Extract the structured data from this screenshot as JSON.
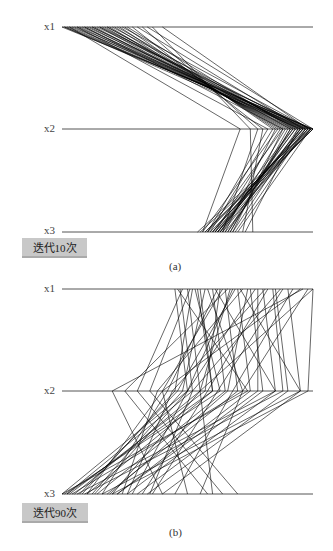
{
  "chart_data": [
    {
      "type": "parallel_coordinates",
      "title": "",
      "caption": "(a)",
      "badge": "迭代10次",
      "axes": [
        "x1",
        "x2",
        "x3"
      ],
      "axis_range_px": [
        62,
        313
      ],
      "normalized_range": [
        0,
        1
      ],
      "grid": false,
      "legend": "none",
      "description": "Parallel coordinates plot after 10 iterations; lines cluster at low x1, high x2 (near max), mid-high x3",
      "lines": [
        [
          0.0,
          1.0,
          0.55
        ],
        [
          0.01,
          0.98,
          0.57
        ],
        [
          0.02,
          0.97,
          0.58
        ],
        [
          0.03,
          0.96,
          0.6
        ],
        [
          0.04,
          1.0,
          0.59
        ],
        [
          0.05,
          0.95,
          0.61
        ],
        [
          0.06,
          0.99,
          0.62
        ],
        [
          0.07,
          0.93,
          0.63
        ],
        [
          0.08,
          0.97,
          0.64
        ],
        [
          0.09,
          0.92,
          0.6
        ],
        [
          0.1,
          0.98,
          0.65
        ],
        [
          0.11,
          0.91,
          0.66
        ],
        [
          0.12,
          0.96,
          0.62
        ],
        [
          0.13,
          0.9,
          0.67
        ],
        [
          0.14,
          0.99,
          0.63
        ],
        [
          0.15,
          0.89,
          0.64
        ],
        [
          0.16,
          0.95,
          0.68
        ],
        [
          0.17,
          0.88,
          0.58
        ],
        [
          0.18,
          0.94,
          0.66
        ],
        [
          0.19,
          0.87,
          0.61
        ],
        [
          0.2,
          0.97,
          0.69
        ],
        [
          0.21,
          0.86,
          0.56
        ],
        [
          0.22,
          0.93,
          0.62
        ],
        [
          0.23,
          0.85,
          0.65
        ],
        [
          0.24,
          0.99,
          0.7
        ],
        [
          0.25,
          0.84,
          0.59
        ],
        [
          0.26,
          0.92,
          0.63
        ],
        [
          0.28,
          0.8,
          0.72
        ],
        [
          0.3,
          0.96,
          0.6
        ],
        [
          0.32,
          0.78,
          0.64
        ],
        [
          0.34,
          1.0,
          0.57
        ],
        [
          0.36,
          0.75,
          0.76
        ],
        [
          0.4,
          0.98,
          0.61
        ],
        [
          0.03,
          0.71,
          0.56
        ],
        [
          0.06,
          0.82,
          0.58
        ],
        [
          0.09,
          0.88,
          0.68
        ],
        [
          0.12,
          0.94,
          0.73
        ],
        [
          0.15,
          0.99,
          0.54
        ],
        [
          0.18,
          0.91,
          0.67
        ],
        [
          0.01,
          0.95,
          0.62
        ]
      ]
    },
    {
      "type": "parallel_coordinates",
      "title": "",
      "caption": "(b)",
      "badge": "迭代90次",
      "axes": [
        "x1",
        "x2",
        "x3"
      ],
      "axis_range_px": [
        62,
        313
      ],
      "normalized_range": [
        0,
        1
      ],
      "grid": false,
      "legend": "none",
      "description": "Parallel coordinates plot after 90 iterations; lines spread widely, x1 mid-high, x2 broad, x3 low-mid",
      "lines": [
        [
          0.45,
          0.5,
          0.0
        ],
        [
          0.47,
          0.52,
          0.02
        ],
        [
          0.5,
          0.55,
          0.05
        ],
        [
          0.52,
          0.45,
          0.08
        ],
        [
          0.55,
          0.6,
          0.1
        ],
        [
          0.57,
          0.48,
          0.12
        ],
        [
          0.6,
          0.65,
          0.14
        ],
        [
          0.62,
          0.42,
          0.16
        ],
        [
          0.65,
          0.7,
          0.18
        ],
        [
          0.67,
          0.55,
          0.2
        ],
        [
          0.7,
          0.75,
          0.22
        ],
        [
          0.72,
          0.38,
          0.24
        ],
        [
          0.75,
          0.8,
          0.26
        ],
        [
          0.77,
          0.5,
          0.28
        ],
        [
          0.8,
          0.85,
          0.3
        ],
        [
          0.82,
          0.58,
          0.32
        ],
        [
          0.85,
          0.9,
          0.34
        ],
        [
          0.88,
          0.62,
          0.36
        ],
        [
          0.9,
          0.95,
          0.4
        ],
        [
          0.92,
          0.68,
          0.45
        ],
        [
          0.95,
          0.4,
          0.5
        ],
        [
          0.98,
          0.72,
          0.55
        ],
        [
          1.0,
          0.55,
          0.6
        ],
        [
          0.48,
          0.3,
          0.64
        ],
        [
          0.51,
          0.35,
          0.7
        ],
        [
          0.54,
          0.6,
          0.02
        ],
        [
          0.58,
          0.72,
          0.04
        ],
        [
          0.61,
          0.85,
          0.06
        ],
        [
          0.64,
          0.4,
          0.1
        ],
        [
          0.68,
          0.5,
          0.13
        ],
        [
          0.71,
          0.95,
          0.16
        ],
        [
          0.74,
          0.66,
          0.19
        ],
        [
          0.78,
          0.78,
          0.22
        ],
        [
          0.81,
          0.44,
          0.26
        ],
        [
          0.84,
          0.88,
          0.09
        ],
        [
          0.87,
          0.52,
          0.35
        ],
        [
          0.46,
          0.74,
          0.0
        ],
        [
          0.53,
          0.63,
          0.01
        ],
        [
          0.63,
          0.57,
          0.03
        ],
        [
          0.69,
          0.46,
          0.07
        ],
        [
          1.0,
          0.98,
          0.2
        ],
        [
          0.96,
          0.2,
          0.4
        ],
        [
          0.66,
          0.25,
          0.58
        ]
      ]
    }
  ],
  "panels": [
    {
      "axis_labels": [
        "x1",
        "x2",
        "x3"
      ],
      "badge": "迭代10次",
      "caption": "(a)"
    },
    {
      "axis_labels": [
        "x1",
        "x2",
        "x3"
      ],
      "badge": "迭代90次",
      "caption": "(b)"
    }
  ],
  "colors": {
    "axis": "#555555",
    "line": "#000000",
    "badge_bg": "#c8c8c8"
  }
}
